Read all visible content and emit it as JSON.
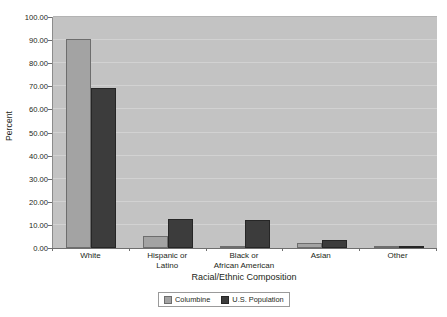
{
  "chart_data": {
    "type": "bar",
    "title": "",
    "subtitle": "",
    "xlabel": "Racial/Ethnic Composition",
    "ylabel": "Percent",
    "categories": [
      "White",
      "Hispanic or Latino",
      "Black or African American",
      "Asian",
      "Other"
    ],
    "category_lines": [
      [
        "White"
      ],
      [
        "Hispanic or",
        "Latino"
      ],
      [
        "Black or",
        "African American"
      ],
      [
        "Asian"
      ],
      [
        "Other"
      ]
    ],
    "series": [
      {
        "name": "Columbine",
        "color": "#a3a3a3",
        "values": [
          90.5,
          5.4,
          0.5,
          2.2,
          0.5
        ]
      },
      {
        "name": "U.S. Population",
        "color": "#3c3c3c",
        "values": [
          69.1,
          12.5,
          12.1,
          3.6,
          0.9
        ]
      }
    ],
    "ylim": [
      0,
      100
    ],
    "ytick_step": 10,
    "ytick_labels": [
      "100.00",
      "90.00",
      "80.00",
      "70.00",
      "60.00",
      "50.00",
      "40.00",
      "30.00",
      "20.00",
      "10.00",
      "0.00"
    ],
    "ytick_values": [
      100,
      90,
      80,
      70,
      60,
      50,
      40,
      30,
      20,
      10,
      0
    ],
    "grid": true,
    "grid_axis": "y",
    "legend_position": "bottom",
    "plot_background": "#c3c3c3",
    "figure_background": "#ffffff"
  },
  "legend": {
    "items": [
      {
        "label": "Columbine"
      },
      {
        "label": "U.S. Population"
      }
    ]
  }
}
